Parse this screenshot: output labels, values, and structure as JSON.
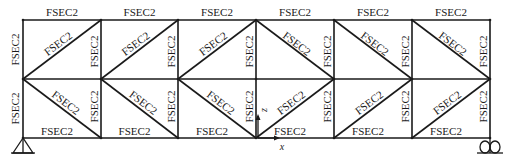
{
  "diagram": {
    "type": "truss",
    "section_label": "FSEC2",
    "panel_count": 6,
    "chord_y": {
      "top": 20,
      "middle": 79,
      "bottom": 138
    },
    "panel_x": [
      23,
      101,
      178,
      256,
      334,
      412,
      490
    ],
    "top_chord_labels": [
      "FSEC2",
      "FSEC2",
      "FSEC2",
      "FSEC2",
      "FSEC2",
      "FSEC2"
    ],
    "bottom_chord_labels": [
      "FSEC2",
      "FSEC2",
      "FSEC2",
      "FSEC2",
      "FSEC2",
      "FSEC2"
    ],
    "upper_vertical_labels": [
      "FSEC2",
      "FSEC2",
      "FSEC2",
      "FSEC2",
      "FSEC2",
      "FSEC2"
    ],
    "lower_vertical_labels": [
      "FSEC2",
      "FSEC2",
      "FSEC2",
      "FSEC2",
      "FSEC2",
      "FSEC2"
    ],
    "upper_diagonal_labels": [
      "FSEC2",
      "FSEC2",
      "FSEC2",
      "FSEC2",
      "FSEC2",
      "FSEC2"
    ],
    "lower_diagonal_labels": [
      "FSEC2",
      "FSEC2",
      "FSEC2",
      "FSEC2",
      "FSEC2",
      "FSEC2"
    ],
    "upper_diagonal_direction": [
      "up",
      "up",
      "up",
      "down",
      "down",
      "down"
    ],
    "lower_diagonal_direction": [
      "down",
      "down",
      "down",
      "up",
      "up",
      "up"
    ],
    "axes": {
      "x_label": "x",
      "z_label": "z"
    },
    "supports": {
      "left": "pin",
      "right": "roller"
    },
    "colors": {
      "line": "#1a1a1a",
      "background": "#ffffff"
    }
  }
}
